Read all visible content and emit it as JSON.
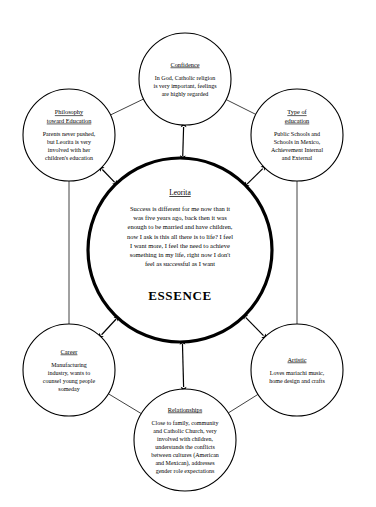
{
  "diagram": {
    "type": "concept-map",
    "background_color": "#ffffff",
    "line_color": "#000000",
    "core": {
      "id": "essence",
      "title": "Leorita",
      "label": "ESSENCE",
      "cx": 180,
      "cy": 250,
      "r": 92,
      "body_lines": [
        "Success is different for me now than it",
        "was five years ago, back then it was",
        "enough to be married and have children,",
        "now I ask is this all there is to life? I feel",
        "I want more, I feel the need to achieve",
        "something in my life, right now I don't",
        "feel as successful as I want"
      ]
    },
    "nodes": [
      {
        "id": "confidence",
        "title": "Confidence",
        "cx": 185,
        "cy": 79,
        "r": 46,
        "title_lines": [
          "Confidence"
        ],
        "body_lines": [
          "In God, Catholic religion",
          "is very important, feelings",
          "are highly regarded"
        ]
      },
      {
        "id": "philosophy-toward-education",
        "title": "Philosophy toward Education",
        "cx": 69,
        "cy": 135,
        "r": 46,
        "title_lines": [
          "Philosophy",
          "toward Education"
        ],
        "body_lines": [
          "Parents never pushed,",
          "but Leorita is very",
          "involved with her",
          "children's education"
        ]
      },
      {
        "id": "type-of-education",
        "title": "Type of education",
        "cx": 297,
        "cy": 135,
        "r": 46,
        "title_lines": [
          "Type of",
          "education"
        ],
        "body_lines": [
          "Public Schools and",
          "Schools in Mexico,",
          "Achievement Internal",
          "and External"
        ]
      },
      {
        "id": "career",
        "title": "Career",
        "cx": 69,
        "cy": 370,
        "r": 46,
        "title_lines": [
          "Career"
        ],
        "body_lines": [
          "Manufacturing",
          "industry, wants to",
          "counsel young people",
          "someday"
        ]
      },
      {
        "id": "artistic",
        "title": "Artistic",
        "cx": 297,
        "cy": 370,
        "r": 46,
        "title_lines": [
          "Artistic"
        ],
        "body_lines": [
          "Loves mariachi music,",
          "home design and crafts"
        ]
      },
      {
        "id": "relationships",
        "title": "Relationships",
        "cx": 185,
        "cy": 440,
        "r": 51,
        "title_lines": [
          "Relationships"
        ],
        "body_lines": [
          "Close to family, community",
          "and Catholic Church, very",
          "involved with children,",
          "understands the conflicts",
          "between cultures (American",
          "and Mexican), addresses",
          "gender role expectations"
        ]
      }
    ],
    "ring_connections": [
      {
        "from": "philosophy-toward-education",
        "to": "confidence"
      },
      {
        "from": "confidence",
        "to": "type-of-education"
      },
      {
        "from": "type-of-education",
        "to": "artistic"
      },
      {
        "from": "artistic",
        "to": "relationships"
      },
      {
        "from": "relationships",
        "to": "career"
      },
      {
        "from": "career",
        "to": "philosophy-toward-education"
      }
    ],
    "core_connections": [
      {
        "node": "confidence",
        "style": "double-arrow"
      },
      {
        "node": "philosophy-toward-education",
        "style": "double-arrow"
      },
      {
        "node": "type-of-education",
        "style": "double-arrow"
      },
      {
        "node": "career",
        "style": "double-arrow"
      },
      {
        "node": "artistic",
        "style": "double-arrow"
      },
      {
        "node": "relationships",
        "style": "double-arrow"
      }
    ]
  }
}
